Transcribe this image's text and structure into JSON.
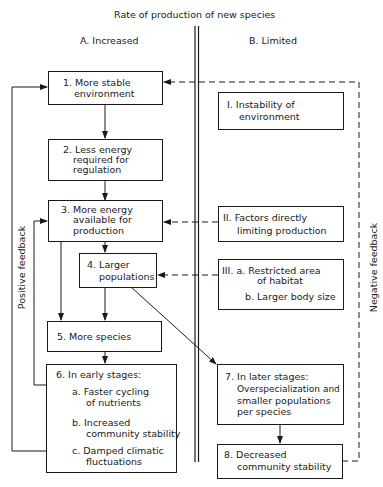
{
  "title": "Rate of production of new species",
  "columns": {
    "a": "A.  Increased",
    "b": "B. Limited"
  },
  "side_labels": {
    "left": "Positive  feedback",
    "right": "Negative  feedback"
  },
  "boxes": {
    "b1": {
      "lines": [
        "1. More stable",
        "environment"
      ]
    },
    "b2": {
      "lines": [
        "2. Less energy",
        "required for",
        "regulation"
      ]
    },
    "b3": {
      "lines": [
        "3. More energy",
        "available for",
        "production"
      ]
    },
    "b4": {
      "lines": [
        "4. Larger",
        "populations"
      ]
    },
    "b5": {
      "lines": [
        "5.  More species"
      ]
    },
    "b6": {
      "lines": [
        "6.  In early stages:",
        "a.  Faster cycling",
        "of nutrients",
        "b.  Increased",
        "community stability",
        "c.  Damped climatic",
        "fluctuations"
      ]
    },
    "bI": {
      "lines": [
        "I. Instability of",
        "environment"
      ]
    },
    "bII": {
      "lines": [
        "II. Factors directly",
        "limiting production"
      ]
    },
    "bIII": {
      "lines": [
        "III.  a. Restricted area",
        "of habitat",
        "b. Larger body size"
      ]
    },
    "b7": {
      "lines": [
        "7.  In later stages:",
        "Overspecialization and",
        "smaller populations",
        "per species"
      ]
    },
    "b8": {
      "lines": [
        "8.  Decreased",
        "community stability"
      ]
    }
  },
  "colors": {
    "ink": "#1a1a1a",
    "background": "#ffffff"
  }
}
